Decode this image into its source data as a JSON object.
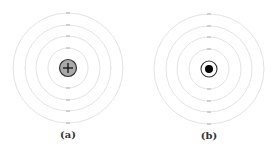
{
  "figure": {
    "panels": [
      {
        "caption": "(a)",
        "nucleus": {
          "type": "positive-charge",
          "symbol": "+",
          "fill": "#a8a8a8",
          "stroke": "#333333"
        },
        "center": [
          68,
          68
        ],
        "orbit_radii": [
          20,
          32,
          43,
          55
        ]
      },
      {
        "caption": "(b)",
        "nucleus": {
          "type": "point-mass",
          "fill": "#000000",
          "ring_stroke": "#333333"
        },
        "center": [
          72,
          69
        ],
        "orbit_radii": [
          20,
          32,
          43,
          55
        ]
      }
    ],
    "colors": {
      "orbit": "#dcdcdc",
      "tick": "#b0b0b0"
    }
  }
}
